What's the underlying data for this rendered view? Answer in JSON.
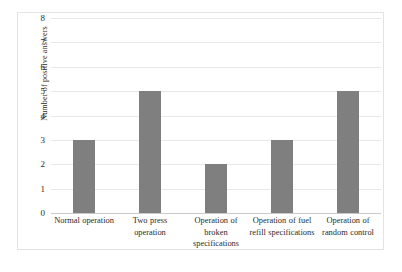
{
  "chart_data": {
    "type": "bar",
    "title": "",
    "xlabel": "",
    "ylabel": "Number of positive answers",
    "categories": [
      "Normal operation",
      "Two press operation",
      "Operation of broken specifications",
      "Operation of fuel refill specifications",
      "Operation of random control"
    ],
    "values": [
      3,
      5,
      2,
      3,
      5
    ],
    "ylim": [
      0,
      8
    ],
    "ytick_labels": [
      "8",
      "7",
      "6",
      "5",
      "4",
      "3",
      "2",
      "1",
      "0"
    ],
    "ytick_values": [
      8,
      7,
      6,
      5,
      4,
      3,
      2,
      1,
      0
    ],
    "grid": true,
    "legend": "none",
    "bar_color": "#7f7f7f",
    "gridline_color": "#e8e8e8",
    "axis_color": "#c9c9c9",
    "frame_color": "#e3e3e3",
    "background": "#ffffff"
  }
}
